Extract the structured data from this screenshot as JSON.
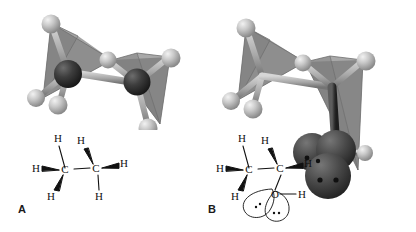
{
  "figure": {
    "background_color": "#ffffff",
    "panels": [
      {
        "id": "A",
        "label": "A",
        "molecule_name": "ethane",
        "molecular_formula": "C2H6",
        "model": {
          "type": "ball-and-stick-with-tetrahedra",
          "description": "Two edge-sharing tetrahedra with carbon atoms at shared centers and hydrogen atoms at apices",
          "atom_colors": {
            "carbon": "#3a3a3a",
            "hydrogen": "#b5b5b5",
            "bond": "#9a9a9a",
            "tetrahedron_face": "#8e8e8e",
            "tetrahedron_edge": "#6f6f6f"
          },
          "atoms": [
            {
              "element": "C",
              "label": "C"
            },
            {
              "element": "C",
              "label": "C"
            },
            {
              "element": "H",
              "label": "H"
            },
            {
              "element": "H",
              "label": "H"
            },
            {
              "element": "H",
              "label": "H"
            },
            {
              "element": "H",
              "label": "H"
            },
            {
              "element": "H",
              "label": "H"
            },
            {
              "element": "H",
              "label": "H"
            }
          ]
        },
        "lewis": {
          "atom_labels": [
            "H",
            "H",
            "C",
            "H",
            "H",
            "C",
            "H",
            "H"
          ],
          "center_left": "C",
          "center_right": "C",
          "h_left_top": "H",
          "h_left_side": "H",
          "h_left_bottom": "H",
          "h_right_top": "H",
          "h_right_side": "H",
          "h_right_bottom": "H",
          "stroke_color": "#111111"
        }
      },
      {
        "id": "B",
        "label": "B",
        "molecule_name": "ethanol",
        "molecular_formula": "C2H5OH",
        "model": {
          "type": "ball-and-stick-with-tetrahedra",
          "description": "Two edge-sharing tetrahedra plus an oxygen with two dark lone-pair lobes bearing electron dots",
          "atom_colors": {
            "carbon": "#3a3a3a",
            "hydrogen": "#b5b5b5",
            "oxygen": "#4a4a4a",
            "lone_pair_lobe": "#464646",
            "lone_pair_dot": "#141414",
            "bond": "#9a9a9a",
            "tetrahedron_face": "#8e8e8e",
            "tetrahedron_edge": "#6f6f6f"
          },
          "lone_pair_count": 2
        },
        "lewis": {
          "center_left": "C",
          "center_right": "C",
          "h_left_top": "H",
          "h_left_side": "H",
          "h_left_bottom": "H",
          "h_right_top": "H",
          "h_right_side": "H",
          "oxygen": "O",
          "h_hydroxyl": "H",
          "lone_pair_dots": [
            "··",
            "··"
          ],
          "stroke_color": "#111111"
        }
      }
    ]
  }
}
